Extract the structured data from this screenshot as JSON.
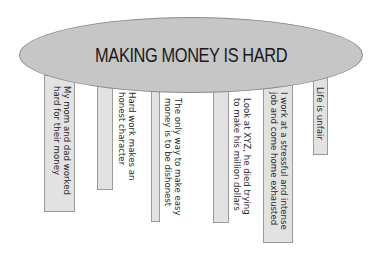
{
  "diagram": {
    "title": "MAKING MONEY IS HARD",
    "colors": {
      "ellipse_fill": "#c6c6c6",
      "ellipse_border": "#8a8a8a",
      "leg_fill": "#e2e2e2",
      "leg_border": "#9a9a9a",
      "text": "#2a2a2a"
    },
    "legs": [
      {
        "label": "My mom and dad worked\nhard for their money"
      },
      {
        "label": "Hard work makes an\nhonest character"
      },
      {
        "label": "The only way to make easy\nmoney is to be dishonest"
      },
      {
        "label": "Look at XYZ, he died trying\nto make his million dollars"
      },
      {
        "label": "I work at a stressful and intense\njob and come home exhausted"
      },
      {
        "label": "Life is unfair"
      }
    ]
  }
}
